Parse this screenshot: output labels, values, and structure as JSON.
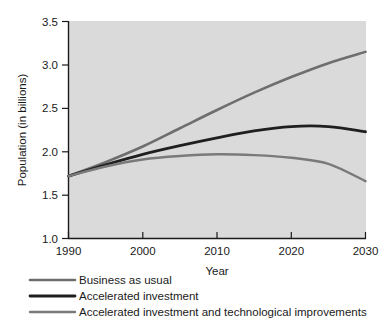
{
  "chart_data": {
    "type": "line",
    "title": "",
    "xlabel": "Year",
    "ylabel": "Population (in billions)",
    "xlim": [
      1990,
      2030
    ],
    "ylim": [
      1.0,
      3.5
    ],
    "grid": false,
    "legend_position": "below",
    "background_color": "#d9d9d9",
    "x": [
      1990,
      1995,
      2000,
      2005,
      2010,
      2015,
      2020,
      2025,
      2030
    ],
    "xticks": [
      "1990",
      "2000",
      "2010",
      "2020",
      "2030"
    ],
    "xtick_values": [
      1990,
      2000,
      2010,
      2020,
      2030
    ],
    "yticks": [
      "1.0",
      "1.5",
      "2.0",
      "2.5",
      "3.0",
      "3.5"
    ],
    "ytick_values": [
      1.0,
      1.5,
      2.0,
      2.5,
      3.0,
      3.5
    ],
    "series": [
      {
        "name": "Business as usual",
        "color": "#6e6e6e",
        "line_width": 2.6,
        "values": [
          1.72,
          1.88,
          2.06,
          2.27,
          2.48,
          2.68,
          2.86,
          3.02,
          3.15
        ]
      },
      {
        "name": "Accelerated investment",
        "color": "#1f1f1f",
        "line_width": 2.8,
        "values": [
          1.72,
          1.85,
          1.97,
          2.07,
          2.16,
          2.24,
          2.29,
          2.29,
          2.23
        ]
      },
      {
        "name": "Accelerated investment and technological improvements",
        "color": "#7a7a7a",
        "line_width": 2.4,
        "values": [
          1.72,
          1.83,
          1.91,
          1.95,
          1.97,
          1.96,
          1.93,
          1.86,
          1.66
        ]
      }
    ]
  },
  "axes": {
    "y_title": "Population (in billions)",
    "x_title": "Year",
    "y_tick_labels": [
      "3.5",
      "3.0",
      "2.5",
      "2.0",
      "1.5",
      "1.0"
    ],
    "x_tick_labels": [
      "1990",
      "2000",
      "2010",
      "2020",
      "2030"
    ]
  },
  "legend": {
    "items": [
      {
        "label": "Business as usual",
        "color": "#6e6e6e"
      },
      {
        "label": "Accelerated investment",
        "color": "#1f1f1f"
      },
      {
        "label": "Accelerated investment and technological improvements",
        "color": "#7a7a7a"
      }
    ]
  }
}
